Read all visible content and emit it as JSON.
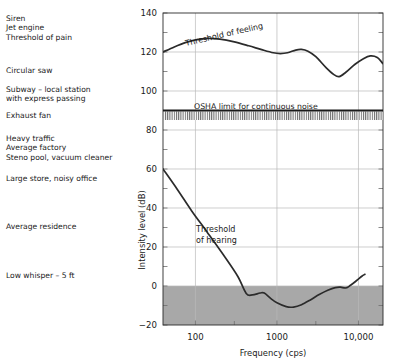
{
  "chart_data": {
    "type": "line",
    "title": "",
    "xlabel": "Frequency (cps)",
    "ylabel": "Intensity level (dB)",
    "xscale": "log",
    "xlim": [
      40,
      20000
    ],
    "ylim": [
      -20,
      140
    ],
    "grid": true,
    "legend": "none",
    "ytick_labels": [
      "140",
      "120",
      "100",
      "80",
      "60",
      "40",
      "20",
      "0",
      "−20"
    ],
    "ytick_values": [
      140,
      120,
      100,
      80,
      60,
      40,
      20,
      0,
      -20
    ],
    "yminor_values": [
      130,
      110,
      90,
      70,
      50,
      30,
      10,
      -10
    ],
    "xtick_labels": [
      "100",
      "1000",
      "10,000"
    ],
    "xtick_values": [
      100,
      1000,
      10000
    ],
    "series": [
      {
        "name": "Threshold of feeling",
        "annotation": "Threshold of feeling",
        "points": [
          [
            40,
            120.0
          ],
          [
            55,
            122.6
          ],
          [
            75,
            124.8
          ],
          [
            100,
            126.2
          ],
          [
            140,
            127.0
          ],
          [
            200,
            126.6
          ],
          [
            300,
            125.2
          ],
          [
            450,
            123.2
          ],
          [
            650,
            121.2
          ],
          [
            900,
            119.6
          ],
          [
            1100,
            119.2
          ],
          [
            1350,
            119.6
          ],
          [
            1700,
            121.0
          ],
          [
            2000,
            121.3
          ],
          [
            2400,
            120.4
          ],
          [
            3000,
            117.6
          ],
          [
            4000,
            112.0
          ],
          [
            5000,
            108.4
          ],
          [
            5800,
            107.4
          ],
          [
            7000,
            109.6
          ],
          [
            9000,
            113.6
          ],
          [
            11500,
            116.6
          ],
          [
            14000,
            118.0
          ],
          [
            17000,
            117.2
          ],
          [
            20000,
            114.0
          ]
        ]
      },
      {
        "name": "Threshold of hearing",
        "annotation": "Threshold of hearing",
        "points": [
          [
            40,
            60.0
          ],
          [
            60,
            49.5
          ],
          [
            90,
            38.5
          ],
          [
            140,
            27.5
          ],
          [
            220,
            16.0
          ],
          [
            330,
            5.0
          ],
          [
            420,
            -3.8
          ],
          [
            500,
            -4.6
          ],
          [
            620,
            -3.6
          ],
          [
            700,
            -3.6
          ],
          [
            850,
            -6.6
          ],
          [
            1000,
            -8.6
          ],
          [
            1300,
            -10.6
          ],
          [
            1600,
            -10.8
          ],
          [
            2000,
            -9.6
          ],
          [
            2600,
            -7.0
          ],
          [
            3300,
            -4.4
          ],
          [
            4200,
            -2.2
          ],
          [
            5200,
            -0.8
          ],
          [
            6000,
            -0.6
          ],
          [
            7000,
            -1.0
          ],
          [
            8000,
            0.4
          ],
          [
            9500,
            2.8
          ],
          [
            11000,
            5.0
          ],
          [
            12000,
            6.0
          ]
        ]
      }
    ],
    "annotations": [
      {
        "text": "Threshold of feeling",
        "kind": "curve-label"
      },
      {
        "text": "Threshold of hearing",
        "kind": "curve-label"
      },
      {
        "text": "OSHA limit for continuous noise",
        "kind": "reference-line-label",
        "value": 90
      }
    ],
    "reference_lines": [
      {
        "label": "OSHA limit for continuous noise",
        "y": 90,
        "hatched_below": true
      }
    ],
    "shaded_region": {
      "description": "inaudible region below 0 dB",
      "y_from": -20,
      "y_to": 0,
      "color": "#a8a8a8"
    }
  },
  "noise_labels": [
    {
      "text": "Siren\nJet engine\nThreshold of pain",
      "top": 14
    },
    {
      "text": "Circular saw",
      "top": 66
    },
    {
      "text": "Subway – local station\nwith express passing",
      "top": 85
    },
    {
      "text": "Exhaust fan",
      "top": 111
    },
    {
      "text": "Heavy traffic\nAverage factory\nSteno pool, vacuum cleaner",
      "top": 134
    },
    {
      "text": "Large store, noisy office",
      "top": 174
    },
    {
      "text": "Average residence",
      "top": 222
    },
    {
      "text": "Low whisper – 5 ft",
      "top": 271
    }
  ],
  "colors": {
    "curve": "#2b2b2b",
    "grid": "#b9b9b9",
    "shade": "#a8a8a8",
    "background": "#ffffff"
  }
}
